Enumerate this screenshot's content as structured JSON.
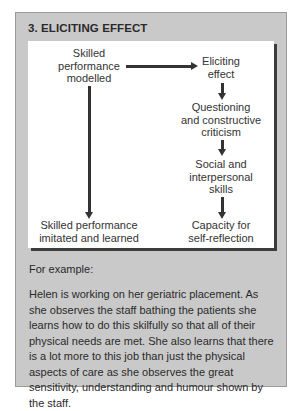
{
  "box": {
    "title": "3. ELICITING EFFECT",
    "background_color": "#c9c9c9",
    "inner_background_color": "#ffffff",
    "shadow_color": "#3c3c3c"
  },
  "diagram": {
    "left_column": {
      "top": "Skilled performance modelled",
      "top_lines": [
        "Skilled",
        "performance",
        "modelled"
      ],
      "bottom": "Skilled performance imitated and learned",
      "bottom_lines": [
        "Skilled performance",
        "imitated and learned"
      ]
    },
    "right_column": [
      {
        "label": "Eliciting effect",
        "lines": [
          "Eliciting",
          "effect"
        ]
      },
      {
        "label": "Questioning and constructive criticism",
        "lines": [
          "Questioning",
          "and constructive",
          "criticism"
        ]
      },
      {
        "label": "Social and interpersonal skills",
        "lines": [
          "Social and",
          "interpersonal",
          "skills"
        ]
      },
      {
        "label": "Capacity for self-reflection",
        "lines": [
          "Capacity for",
          "self-reflection"
        ]
      }
    ],
    "edges": [
      {
        "from": "Skilled performance modelled",
        "to": "Eliciting effect",
        "direction": "right"
      },
      {
        "from": "Skilled performance modelled",
        "to": "Skilled performance imitated and learned",
        "direction": "down"
      },
      {
        "from": "Eliciting effect",
        "to": "Questioning and constructive criticism",
        "direction": "down"
      },
      {
        "from": "Questioning and constructive criticism",
        "to": "Social and interpersonal skills",
        "direction": "down"
      },
      {
        "from": "Social and interpersonal skills",
        "to": "Capacity for self-reflection",
        "direction": "down"
      }
    ]
  },
  "example": {
    "label": "For example:",
    "text": "Helen is working on her geriatric placement.  As she observes the staff bathing the patients she learns how to do this skilfully so that all of their physical needs are met. She also learns that there is a lot more to this job than just the physical aspects of care as she observes the great sensitivity, understanding and humour shown by the staff."
  }
}
